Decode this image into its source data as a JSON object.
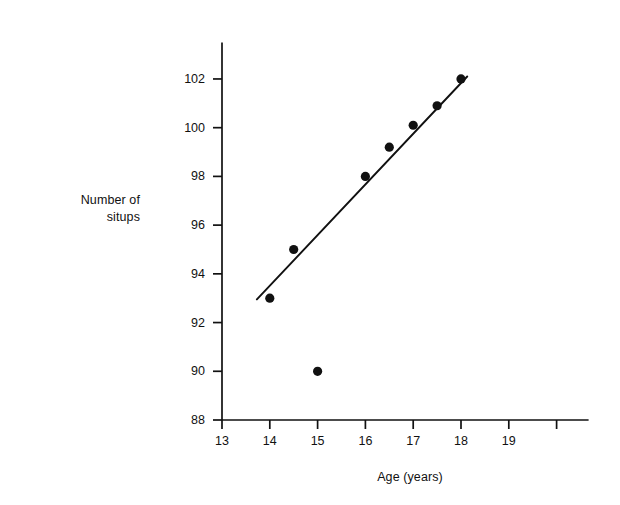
{
  "chart_data": {
    "type": "scatter",
    "title": "",
    "xlabel": "Age (years)",
    "ylabel": "Number of situps",
    "ylabel_lines": [
      "Number of",
      "situps"
    ],
    "xlim": [
      13,
      20
    ],
    "ylim": [
      88,
      103.5
    ],
    "grid": false,
    "legend": null,
    "x_ticks": [
      13,
      14,
      15,
      16,
      17,
      18,
      19,
      20
    ],
    "x_tick_labels": [
      "13",
      "14",
      "15",
      "16",
      "17",
      "18",
      "19",
      ""
    ],
    "y_ticks": [
      88,
      90,
      92,
      94,
      96,
      98,
      100,
      102
    ],
    "y_tick_labels": [
      "88",
      "90",
      "92",
      "94",
      "96",
      "98",
      "100",
      "102"
    ],
    "series": [
      {
        "name": "observations",
        "type": "scatter",
        "marker": "filled-circle",
        "color": "#111111",
        "points": [
          {
            "x": 14.0,
            "y": 93
          },
          {
            "x": 14.5,
            "y": 95
          },
          {
            "x": 15.0,
            "y": 90
          },
          {
            "x": 16.0,
            "y": 98
          },
          {
            "x": 16.5,
            "y": 99.2
          },
          {
            "x": 17.0,
            "y": 100.1
          },
          {
            "x": 17.5,
            "y": 100.9
          },
          {
            "x": 18.0,
            "y": 102
          }
        ]
      },
      {
        "name": "trend-line",
        "type": "line",
        "color": "#111111",
        "x_start": 13.73,
        "y_start": 92.95,
        "x_end": 18.13,
        "y_end": 102.1
      }
    ]
  },
  "axes": {
    "y_axis_label_line1": "Number of",
    "y_axis_label_line2": "situps",
    "x_axis_label": "Age (years)"
  }
}
